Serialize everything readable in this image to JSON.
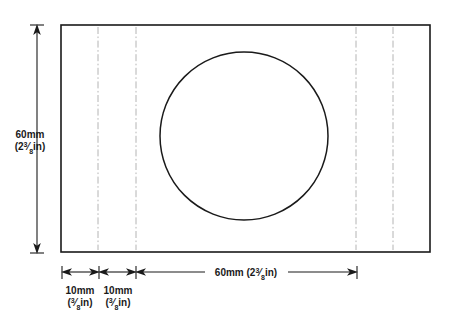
{
  "drawing": {
    "title": "Workpiece layout with circular hole",
    "colors": {
      "outline": "#1a1a1a",
      "center_line": "#b4b4b4",
      "background": "#ffffff"
    },
    "dimensions": {
      "height": {
        "metric": "60mm",
        "imperial_prefix": "(2",
        "imperial_numerator": "3",
        "imperial_denominator": "8",
        "imperial_suffix": "in)"
      },
      "width_main": {
        "metric": "60mm",
        "imperial_prefix": "(2",
        "imperial_numerator": "3",
        "imperial_denominator": "8",
        "imperial_suffix": "in)"
      },
      "margin_first": {
        "metric": "10mm",
        "imperial_prefix": "(",
        "imperial_numerator": "3",
        "imperial_denominator": "8",
        "imperial_suffix": "in)"
      },
      "margin_second": {
        "metric": "10mm",
        "imperial_prefix": "(",
        "imperial_numerator": "3",
        "imperial_denominator": "8",
        "imperial_suffix": "in)"
      }
    },
    "geometry": {
      "rect": {
        "x": 61,
        "y": 25,
        "width": 369,
        "height": 227
      },
      "circle": {
        "cx": 244,
        "cy": 136,
        "r": 84
      },
      "center_lines_x": [
        98,
        136,
        356,
        393
      ]
    }
  }
}
